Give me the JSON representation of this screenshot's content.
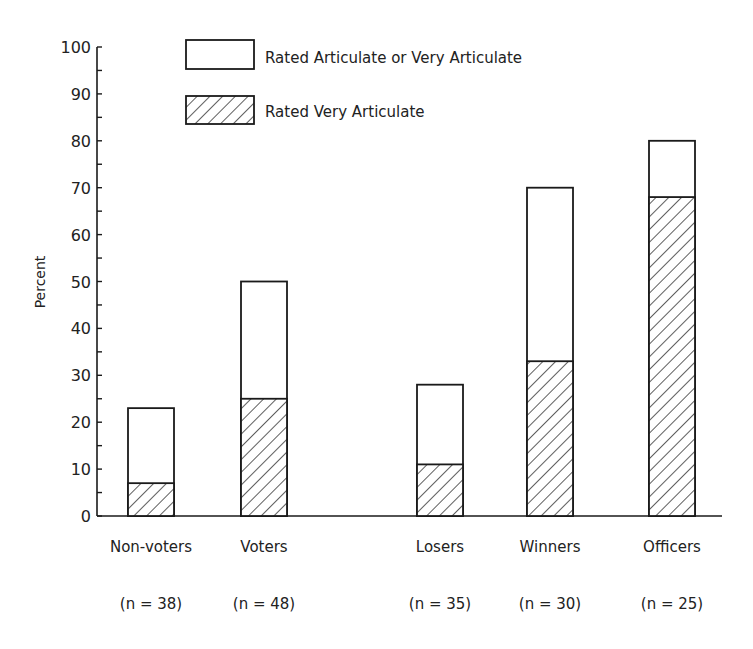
{
  "chart_data": {
    "type": "bar",
    "stacked_overlay": true,
    "title": "",
    "xlabel": "",
    "ylabel": "Percent",
    "ylim": [
      0,
      100
    ],
    "yticks": [
      0,
      10,
      20,
      30,
      40,
      50,
      60,
      70,
      80,
      90,
      100
    ],
    "minor_tick_step": 5,
    "grid": false,
    "legend_position": "top",
    "categories": [
      "Non-voters",
      "Voters",
      "Losers",
      "Winners",
      "Officers"
    ],
    "sample_sizes": [
      "(n = 38)",
      "(n = 48)",
      "(n = 35)",
      "(n = 30)",
      "(n = 25)"
    ],
    "series": [
      {
        "name": "Rated Articulate or Very Articulate",
        "pattern": "open",
        "values": [
          23,
          50,
          28,
          70,
          80
        ]
      },
      {
        "name": "Rated Very Articulate",
        "pattern": "hatched",
        "values": [
          7,
          25,
          11,
          33,
          68
        ]
      }
    ]
  },
  "colors": {
    "ink": "#1a1a1a",
    "background": "#ffffff"
  }
}
